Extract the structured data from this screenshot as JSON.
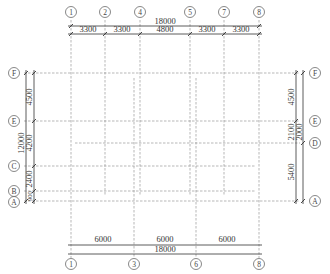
{
  "colors": {
    "grid_line": "#9a9a9a",
    "dimension_line": "#333333",
    "text": "#333333"
  },
  "top_axes": [
    {
      "label": "1",
      "x": 71
    },
    {
      "label": "2",
      "x": 105
    },
    {
      "label": "4",
      "x": 140
    },
    {
      "label": "5",
      "x": 190
    },
    {
      "label": "7",
      "x": 224
    },
    {
      "label": "8",
      "x": 259
    }
  ],
  "bottom_axes": [
    {
      "label": "1",
      "x": 71
    },
    {
      "label": "3",
      "x": 134
    },
    {
      "label": "6",
      "x": 196
    },
    {
      "label": "8",
      "x": 259
    }
  ],
  "left_axes": [
    {
      "label": "F",
      "y": 73
    },
    {
      "label": "E",
      "y": 121
    },
    {
      "label": "C",
      "y": 166
    },
    {
      "label": "B",
      "y": 191
    },
    {
      "label": "A",
      "y": 201
    }
  ],
  "right_axes": [
    {
      "label": "F",
      "y": 73
    },
    {
      "label": "E",
      "y": 121
    },
    {
      "label": "D",
      "y": 143
    },
    {
      "label": "A",
      "y": 201
    }
  ],
  "dimensions": {
    "top_total": "18000",
    "top_segments": [
      "3300",
      "3300",
      "4800",
      "3300",
      "3300"
    ],
    "bottom_segments": [
      "6000",
      "6000",
      "6000"
    ],
    "bottom_total": "18000",
    "left_total": "12000",
    "left_segments": [
      "4500",
      "4200",
      "2400",
      "900"
    ],
    "right_segments": [
      "4500",
      "2100",
      "2000",
      "5400"
    ]
  }
}
